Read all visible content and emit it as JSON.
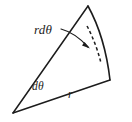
{
  "figure": {
    "kind": "geometry-diagram",
    "background_color": "#ffffff",
    "ink_color": "#1c1c1c",
    "width": 132,
    "height": 122
  },
  "labels": {
    "arc_length": "rdθ",
    "angle": "dθ",
    "radius": "r"
  },
  "geometry": {
    "apex": {
      "x": 13,
      "y": 113
    },
    "upper_ray_end": {
      "x": 88,
      "y": 6
    },
    "lower_ray_end": {
      "x": 110,
      "y": 80
    },
    "outer_arc": {
      "start_x": 88,
      "start_y": 6,
      "end_x": 110,
      "end_y": 80,
      "radius": 131
    },
    "inner_dashed_arc": {
      "start_x": 87,
      "start_y": 26,
      "end_x": 101,
      "end_y": 63,
      "radius": 102
    },
    "leader_arrow": {
      "from_x": 62,
      "from_y": 30,
      "to_x": 90,
      "to_y": 47
    }
  }
}
